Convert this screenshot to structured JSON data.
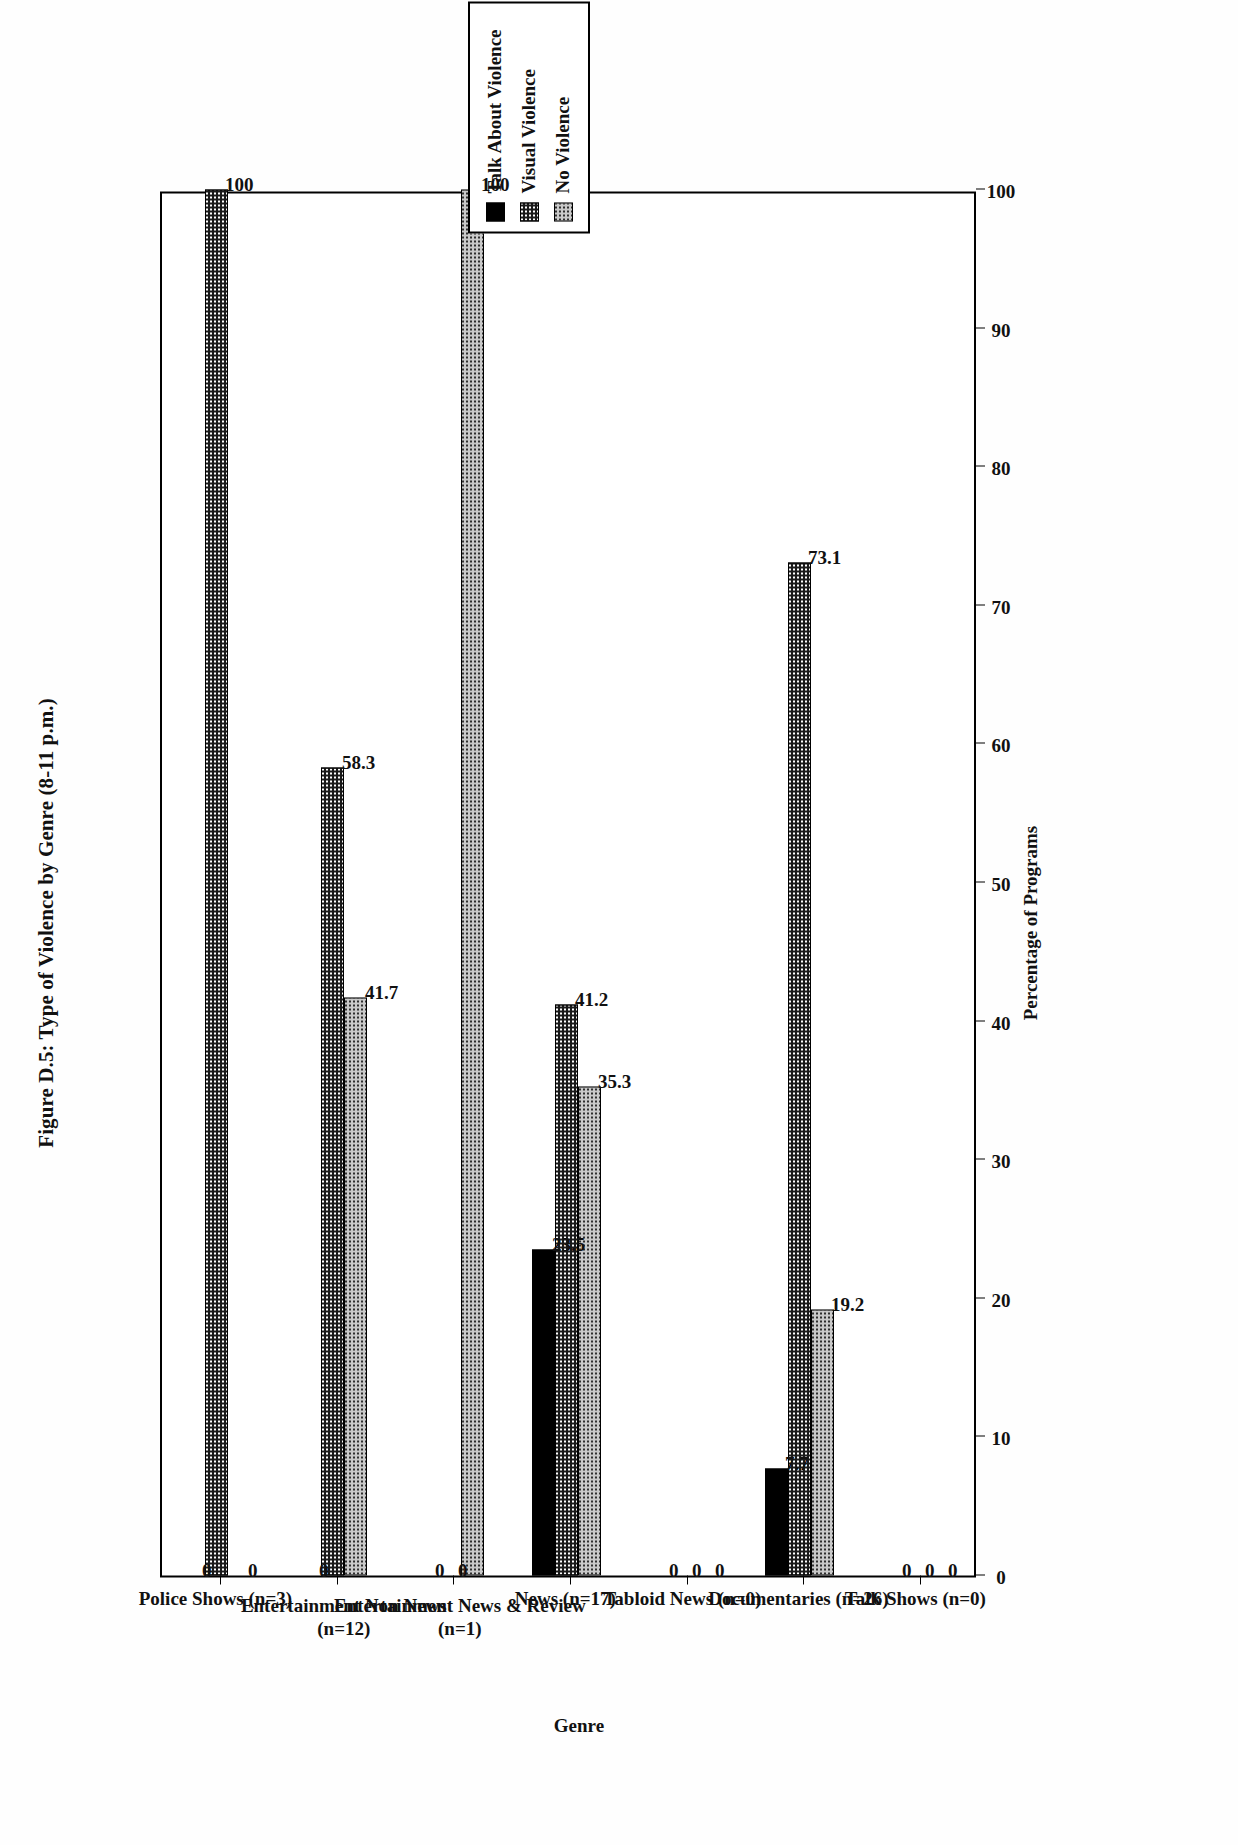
{
  "figure": {
    "title": "Figure D.5: Type of Violence by Genre (8-11 p.m.)",
    "xlabel": "Percentage of Programs",
    "ylabel": "Genre"
  },
  "legend": {
    "items": [
      {
        "label": "Talk About Violence",
        "pattern": "solid-black",
        "swatch": "#000000"
      },
      {
        "label": "Visual Violence",
        "pattern": "dense-dark-dotted",
        "swatch": "#1a1a1a"
      },
      {
        "label": "No Violence",
        "pattern": "light-gray-dotted",
        "swatch": "#c9c9c9"
      }
    ]
  },
  "axis": {
    "ticks": [
      "0",
      "10",
      "20",
      "30",
      "40",
      "50",
      "60",
      "70",
      "80",
      "90",
      "100"
    ]
  },
  "categories": [
    {
      "line1": "Police Shows (n=3)",
      "line2": ""
    },
    {
      "line1": "Entertainment Non News",
      "line2": "(n=12)"
    },
    {
      "line1": "Entertainment News & Review",
      "line2": "(n=1)"
    },
    {
      "line1": "News (n=17)",
      "line2": ""
    },
    {
      "line1": "Tabloid News (n=0)",
      "line2": ""
    },
    {
      "line1": "Documentaries (n=26)",
      "line2": ""
    },
    {
      "line1": "Talk Shows (n=0)",
      "line2": ""
    }
  ],
  "chart_data": {
    "type": "bar",
    "orientation": "horizontal",
    "title": "Figure D.5: Type of Violence by Genre (8-11 p.m.)",
    "xlabel": "Percentage of Programs",
    "ylabel": "Genre",
    "xlim": [
      0,
      100
    ],
    "grid": false,
    "legend_position": "top-right",
    "categories": [
      "Police Shows (n=3)",
      "Entertainment Non News (n=12)",
      "Entertainment News & Review (n=1)",
      "News (n=17)",
      "Tabloid News (n=0)",
      "Documentaries (n=26)",
      "Talk Shows (n=0)"
    ],
    "series": [
      {
        "name": "Talk About Violence",
        "values": [
          0,
          0,
          0,
          23.5,
          0,
          7.7,
          0
        ],
        "labels": [
          "0",
          "0",
          "0",
          "23.5",
          "0",
          "7.7",
          "0"
        ]
      },
      {
        "name": "Visual Violence",
        "values": [
          100,
          58.3,
          0,
          41.2,
          0,
          73.1,
          0
        ],
        "labels": [
          "100",
          "58.3",
          "0",
          "41.2",
          "0",
          "73.1",
          "0"
        ]
      },
      {
        "name": "No Violence",
        "values": [
          0,
          41.7,
          100,
          35.3,
          0,
          19.2,
          0
        ],
        "labels": [
          "0",
          "41.7",
          "100",
          "35.3",
          "0",
          "19.2",
          "0"
        ]
      }
    ]
  }
}
